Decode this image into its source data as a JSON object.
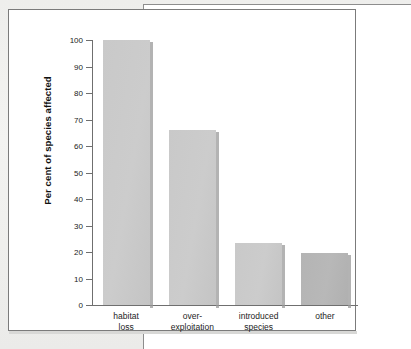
{
  "chart_data": {
    "type": "bar",
    "title": "",
    "subtitle": "",
    "xlabel": "",
    "ylabel": "Per cent of species affected",
    "categories": [
      "habitat loss",
      "over-exploitation",
      "introduced species",
      "other"
    ],
    "category_lines": [
      [
        "habitat",
        "loss"
      ],
      [
        "over-",
        "exploitation"
      ],
      [
        "introduced",
        "species"
      ],
      [
        "other",
        ""
      ]
    ],
    "values": [
      100,
      66,
      23.5,
      19.5
    ],
    "ylim": [
      0,
      100
    ],
    "ytick_labels": [
      "0",
      "10",
      "20",
      "30",
      "40",
      "50",
      "60",
      "70",
      "80",
      "90",
      "100"
    ],
    "ytick_values": [
      0,
      10,
      20,
      30,
      40,
      50,
      60,
      70,
      80,
      90,
      100
    ],
    "grid": false,
    "legend": "none",
    "bar_colors": [
      "#cccccc",
      "#cccccc",
      "#cccccc",
      "#b8b8b8"
    ],
    "axis_color": "#6f6f6f",
    "panel_background": "#ffffff",
    "page_background": "#f2f2f0"
  }
}
